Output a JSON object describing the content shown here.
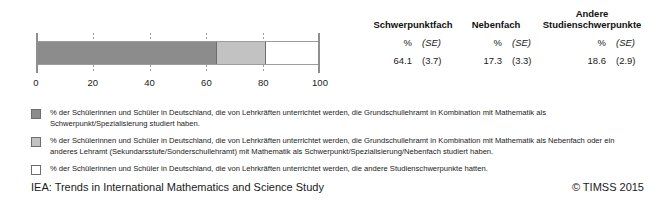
{
  "table": {
    "headers": [
      "Schwerpunktfach",
      "Nebenfach",
      "Andere Studienschwerpunkte"
    ],
    "subheaders": [
      {
        "pct": "%",
        "se": "(SE)"
      },
      {
        "pct": "%",
        "se": "(SE)"
      },
      {
        "pct": "%",
        "se": "(SE)"
      }
    ],
    "values": [
      {
        "pct": "64.1",
        "se": "(3.7)"
      },
      {
        "pct": "17.3",
        "se": "(3.3)"
      },
      {
        "pct": "18.6",
        "se": "(2.9)"
      }
    ]
  },
  "chart_data": {
    "type": "bar",
    "orientation": "horizontal",
    "stacked": true,
    "title": "",
    "xlabel": "",
    "ylabel": "",
    "xlim": [
      0,
      100
    ],
    "grid": true,
    "gridlines": [
      20,
      40,
      60,
      80
    ],
    "tick_labels": [
      "0",
      "20",
      "40",
      "60",
      "80",
      "100"
    ],
    "ticks": [
      0,
      20,
      40,
      60,
      80,
      100
    ],
    "categories": [
      "Deutschland"
    ],
    "series": [
      {
        "name": "Schwerpunktfach",
        "values": [
          64.1
        ],
        "se": [
          3.7
        ],
        "color": "#8c8c8c"
      },
      {
        "name": "Nebenfach",
        "values": [
          17.3
        ],
        "se": [
          3.3
        ],
        "color": "#c2c2c2"
      },
      {
        "name": "Andere Studienschwerpunkte",
        "values": [
          18.6
        ],
        "se": [
          2.9
        ],
        "color": "#ffffff"
      }
    ]
  },
  "legend": {
    "items": [
      {
        "swatch": "dark-gray",
        "color": "#8c8c8c",
        "text": "% der Schülerinnen und Schüler in Deutschland, die von Lehrkräften unterrichtet werden, die Grundschullehramt in Kombination mit Mathematik als Schwerpunkt/Spezialisierung studiert haben."
      },
      {
        "swatch": "light-gray",
        "color": "#c2c2c2",
        "text": "% der Schülerinnen und Schüler in Deutschland, die von Lehrkräften unterrichtet werden, die Grundschullehramt in Kombination mit Mathematik als Nebenfach oder ein anderes Lehramt (Sekundarsstufe/Sonderschullehramt) mit Mathematik als Schwerpunkt/Spezialisierung/Nebenfach studiert haben."
      },
      {
        "swatch": "white",
        "color": "#ffffff",
        "text": "% der Schülerinnen und Schüler in Deutschland, die von Lehrkräften unterrichtet werden, die andere Studienschwerpunkte hatten."
      }
    ]
  },
  "footer": {
    "left": "IEA: Trends in International Mathematics and Science Study",
    "right": "© TIMSS 2015"
  }
}
